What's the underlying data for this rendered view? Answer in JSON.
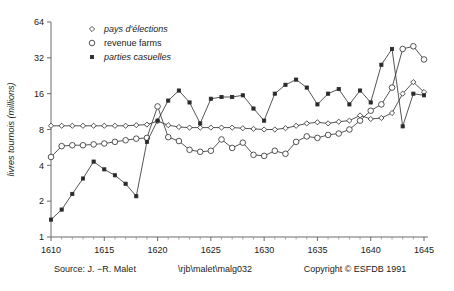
{
  "chart_data": {
    "type": "line",
    "title": "",
    "xlabel": "",
    "ylabel": "livres tournois (millions)",
    "xlim": [
      1610,
      1645
    ],
    "ylim": [
      1,
      64
    ],
    "yscale": "log2",
    "ytick_labels": [
      "1",
      "2",
      "4",
      "8",
      "16",
      "32",
      "64"
    ],
    "ytick_values": [
      1,
      2,
      4,
      8,
      16,
      32,
      64
    ],
    "xtick_labels": [
      "1610",
      "1615",
      "1620",
      "1625",
      "1630",
      "1635",
      "1640",
      "1645"
    ],
    "xtick_values": [
      1610,
      1615,
      1620,
      1625,
      1630,
      1635,
      1640,
      1645
    ],
    "grid": false,
    "legend_position": "top-center",
    "x": [
      1610,
      1611,
      1612,
      1613,
      1614,
      1615,
      1616,
      1617,
      1618,
      1619,
      1620,
      1621,
      1622,
      1623,
      1624,
      1625,
      1626,
      1627,
      1628,
      1629,
      1630,
      1631,
      1632,
      1633,
      1634,
      1635,
      1636,
      1637,
      1638,
      1639,
      1640,
      1641,
      1642,
      1643,
      1644,
      1645
    ],
    "series": [
      {
        "name": "pays d'élections",
        "marker": "diamond",
        "values": [
          8.6,
          8.6,
          8.6,
          8.6,
          8.6,
          8.6,
          8.6,
          8.6,
          8.7,
          8.8,
          9.4,
          8.7,
          8.4,
          8.3,
          8.3,
          8.3,
          8.3,
          8.3,
          8.2,
          8.1,
          8.0,
          8.0,
          8.2,
          8.6,
          9.0,
          9.2,
          9.0,
          9.3,
          9.5,
          10.5,
          9.8,
          10.0,
          11.0,
          16.0,
          20.0,
          16.5
        ]
      },
      {
        "name": "revenue farms",
        "marker": "circle",
        "values": [
          4.7,
          5.8,
          5.9,
          5.9,
          6.0,
          6.1,
          6.3,
          6.5,
          6.7,
          6.8,
          12.5,
          6.9,
          6.4,
          5.4,
          5.2,
          5.3,
          6.6,
          5.6,
          6.2,
          4.9,
          4.8,
          5.3,
          5.0,
          6.3,
          7.0,
          6.8,
          7.2,
          7.4,
          8.0,
          9.5,
          11.5,
          13.0,
          18.0,
          38.0,
          40.0,
          31.0
        ]
      },
      {
        "name": "parties casuelles",
        "marker": "star",
        "values": [
          1.4,
          1.7,
          2.3,
          3.1,
          4.3,
          3.7,
          3.3,
          2.8,
          2.2,
          6.3,
          9.5,
          14.0,
          17.0,
          13.5,
          9.0,
          14.5,
          15.0,
          15.0,
          15.5,
          12.0,
          9.5,
          16.0,
          19.0,
          21.0,
          18.0,
          13.0,
          16.0,
          17.5,
          13.0,
          17.0,
          13.5,
          28.0,
          38.0,
          8.5,
          16.0,
          15.5
        ]
      }
    ]
  },
  "legend": {
    "items": [
      {
        "label": "pays d'élections",
        "marker": "diamond",
        "italic": true
      },
      {
        "label": "revenue farms",
        "marker": "circle",
        "italic": false
      },
      {
        "label": "parties casuelles",
        "marker": "star",
        "italic": true
      }
    ]
  },
  "footer": {
    "source": "Source: J. −R. Malet",
    "file_path": "\\rjb\\malet\\malg032",
    "copyright": "Copyright  © ESFDB 1991"
  }
}
